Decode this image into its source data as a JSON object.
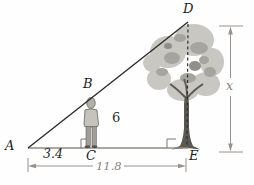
{
  "diagram": {
    "name": "similar-triangles-person-tree",
    "points": {
      "a": "A",
      "b": "B",
      "c": "C",
      "d": "D",
      "e": "E"
    },
    "measurements": {
      "ac": "3.4",
      "ae": "11.8",
      "person_height": "6",
      "tree_height_unknown": "x"
    },
    "colors": {
      "hypotenuse_line": "#2b2b28",
      "base_line": "#8f8a83",
      "dashed_height_line": "#2e2e2c",
      "dimension_line": "#97918a",
      "dimension_text": "#8b847d",
      "label_text": "#1d1d1b",
      "tree_crown": "#c8c7c1",
      "tree_crown_shade": "#a5a49e",
      "tree_crown_dark": "#918f89",
      "tree_trunk": "#5b5851",
      "person_body": "#c6c2bc",
      "background": "#fefefe"
    }
  }
}
